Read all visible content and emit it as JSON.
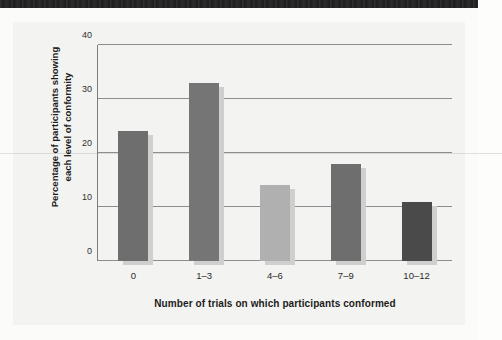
{
  "figure": {
    "background_color": "#f3f3f1",
    "page_color": "#fbfbfa",
    "scan_band_color": "#1d1d1d"
  },
  "chart_data": {
    "type": "bar",
    "title": "",
    "subtitle": "",
    "categories": [
      "0",
      "1–3",
      "4–6",
      "7–9",
      "10–12"
    ],
    "values": [
      24,
      33,
      14,
      18,
      11
    ],
    "bar_colors": [
      "#6e6e6e",
      "#757575",
      "#b0b0b0",
      "#6e6e6e",
      "#4a4a4a"
    ],
    "shadow_color": "#cfcfcd",
    "xlabel": "Number of trials on which participants conformed",
    "ylabel_line1": "Percentage of participants showing",
    "ylabel_line2": "each level of conformity",
    "ylim": [
      0,
      40
    ],
    "yticks": [
      0,
      10,
      20,
      30,
      40
    ],
    "ytick_labels": [
      "0",
      "10",
      "20",
      "30",
      "40"
    ],
    "grid": true,
    "grid_color": "#8d8d8d",
    "legend": "none",
    "axis_color": "#7d7d7d"
  }
}
